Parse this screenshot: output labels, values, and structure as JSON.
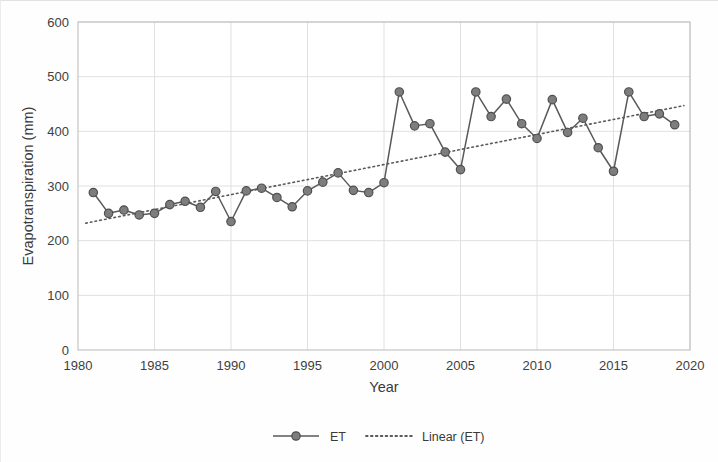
{
  "chart_data": {
    "type": "line",
    "title": "",
    "xlabel": "Year",
    "ylabel": "Evapotranspiration (mm)",
    "xlim": [
      1980,
      2020
    ],
    "ylim": [
      0,
      600
    ],
    "xticks": [
      1980,
      1985,
      1990,
      1995,
      2000,
      2005,
      2010,
      2015,
      2020
    ],
    "yticks": [
      0,
      100,
      200,
      300,
      400,
      500,
      600
    ],
    "grid": true,
    "legend_position": "bottom",
    "x": [
      1981,
      1982,
      1983,
      1984,
      1985,
      1986,
      1987,
      1988,
      1989,
      1990,
      1991,
      1992,
      1993,
      1994,
      1995,
      1996,
      1997,
      1998,
      1999,
      2000,
      2001,
      2002,
      2003,
      2004,
      2005,
      2006,
      2007,
      2008,
      2009,
      2010,
      2011,
      2012,
      2013,
      2014,
      2015,
      2016,
      2017,
      2018,
      2019
    ],
    "series": [
      {
        "name": "ET",
        "type": "line",
        "marker": "circle",
        "color": "#595959",
        "values": [
          288,
          250,
          256,
          247,
          250,
          266,
          272,
          261,
          290,
          235,
          291,
          296,
          279,
          262,
          291,
          307,
          324,
          292,
          288,
          306,
          472,
          410,
          414,
          362,
          330,
          472,
          427,
          459,
          414,
          387,
          458,
          398,
          424,
          370,
          327,
          472,
          427,
          432,
          412
        ]
      },
      {
        "name": "Linear (ET)",
        "type": "trendline",
        "style": "dotted",
        "color": "#5a5a5a",
        "x_endpoints": [
          1980.5,
          2019.6
        ],
        "y_endpoints": [
          232,
          447
        ]
      }
    ],
    "legend": [
      {
        "label": "ET",
        "marker": "line-with-circle",
        "color": "#595959"
      },
      {
        "label": "Linear (ET)",
        "marker": "dotted-line",
        "color": "#5a5a5a"
      }
    ]
  },
  "axes": {
    "y_label": "Evapotranspiration (mm)",
    "x_label": "Year",
    "y_tick_labels": [
      "600",
      "500",
      "400",
      "300",
      "200",
      "100",
      "0"
    ],
    "x_tick_labels": [
      "1980",
      "1985",
      "1990",
      "1995",
      "2000",
      "2005",
      "2010",
      "2015",
      "2020"
    ]
  },
  "legend": {
    "series_label": "ET",
    "trend_label": "Linear (ET)"
  }
}
